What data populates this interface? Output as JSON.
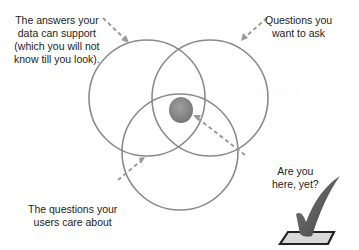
{
  "diagram": {
    "type": "venn",
    "circles": [
      {
        "id": "data",
        "label": "The answers your data can support (which you will not know till you look)."
      },
      {
        "id": "questions",
        "label": "Questions you want to ask"
      },
      {
        "id": "users",
        "label": "The questions your users care about"
      }
    ],
    "intersection": {
      "label": "Are you here, yet?",
      "fill": "#8a8a8a"
    },
    "colors": {
      "circle_stroke": "#8a8a8a",
      "arrow": "#9a9a9a",
      "text": "#222222",
      "check": "#555555"
    }
  },
  "labels": {
    "top_left": [
      "The answers your",
      "data can support",
      "(which you will not",
      "know till you look)."
    ],
    "top_right": [
      "Questions you",
      "want to ask"
    ],
    "bottom_left": [
      "The questions your",
      "users care about"
    ],
    "bottom_right": [
      "Are you",
      "here, yet?"
    ]
  }
}
